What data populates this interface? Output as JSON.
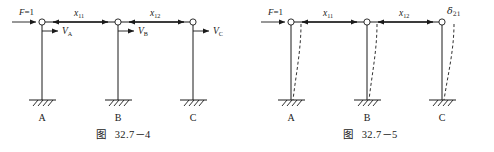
{
  "figures": [
    {
      "id": "fig-32-7-4",
      "caption_cjk": "图",
      "caption_number": "32.7－4",
      "load": {
        "label_main": "F",
        "label_eq": "=1"
      },
      "spans": [
        {
          "name": "x11",
          "base": "x",
          "sub": "11"
        },
        {
          "name": "x12",
          "base": "x",
          "sub": "12"
        }
      ],
      "reactions": [
        {
          "name": "VA",
          "base": "V",
          "sub": "A"
        },
        {
          "name": "VB",
          "base": "V",
          "sub": "B"
        },
        {
          "name": "VC",
          "base": "V",
          "sub": "C"
        }
      ],
      "supports": [
        {
          "name": "A",
          "label": "A"
        },
        {
          "name": "B",
          "label": "B"
        },
        {
          "name": "C",
          "label": "C"
        }
      ]
    },
    {
      "id": "fig-32-7-5",
      "caption_cjk": "图",
      "caption_number": "32.7－5",
      "load": {
        "label_main": "F",
        "label_eq": "=1"
      },
      "spans": [
        {
          "name": "x11",
          "base": "x",
          "sub": "11"
        },
        {
          "name": "x12",
          "base": "x",
          "sub": "12"
        }
      ],
      "displacement": {
        "name": "delta21",
        "base": "δ",
        "sub": "21"
      },
      "supports": [
        {
          "name": "A",
          "label": "A"
        },
        {
          "name": "B",
          "label": "B"
        },
        {
          "name": "C",
          "label": "C"
        }
      ]
    }
  ],
  "colors": {
    "ink": "#1a1a1a",
    "background": "#ffffff"
  }
}
